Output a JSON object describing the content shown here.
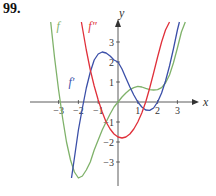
{
  "problem_number": "99.",
  "colors": {
    "f": "#7fb26a",
    "f_prime": "#3b4fa8",
    "f_double_prime": "#e0303a",
    "axis": "#333333"
  },
  "chart_data": {
    "type": "line",
    "title": "",
    "xlabel": "x",
    "ylabel": "y",
    "xlim": [
      -4,
      4
    ],
    "ylim": [
      -4,
      4
    ],
    "x_ticks": [
      -3,
      -2,
      -1,
      1,
      2,
      3
    ],
    "x_tick_labels": [
      "−3",
      "−2",
      "−1",
      "1",
      "2",
      "3"
    ],
    "y_ticks": [
      3,
      2,
      1,
      -1,
      -2,
      -3
    ],
    "y_tick_labels": [
      "3",
      "2",
      "1",
      "−1",
      "−2",
      "−3"
    ],
    "grid": false,
    "legend": "inline curve labels",
    "series": [
      {
        "name": "f",
        "label": "f",
        "x": [
          -3.4,
          -3.2,
          -3.0,
          -2.8,
          -2.6,
          -2.4,
          -2.2,
          -2.0,
          -1.8,
          -1.6,
          -1.4,
          -1.2,
          -1.0,
          -0.8,
          -0.6,
          -0.4,
          -0.2,
          0.0,
          0.2,
          0.4,
          0.6,
          0.8,
          1.0,
          1.2,
          1.4,
          1.6,
          1.8,
          2.0,
          2.2,
          2.4,
          2.6,
          2.8,
          3.0,
          3.2,
          3.4
        ],
        "y": [
          4.0,
          2.2,
          0.6,
          -0.8,
          -2.0,
          -2.9,
          -3.5,
          -3.8,
          -3.7,
          -3.4,
          -3.0,
          -2.4,
          -1.9,
          -1.4,
          -1.0,
          -0.6,
          -0.25,
          0.0,
          0.25,
          0.45,
          0.62,
          0.72,
          0.78,
          0.75,
          0.68,
          0.62,
          0.6,
          0.62,
          0.72,
          0.95,
          1.35,
          1.95,
          2.7,
          3.5,
          4.0
        ]
      },
      {
        "name": "f'",
        "label": "f′",
        "x": [
          -2.35,
          -2.2,
          -2.0,
          -1.8,
          -1.6,
          -1.4,
          -1.2,
          -1.0,
          -0.8,
          -0.6,
          -0.4,
          -0.2,
          0.0,
          0.2,
          0.4,
          0.6,
          0.8,
          1.0,
          1.2,
          1.4,
          1.6,
          1.8,
          2.0,
          2.2,
          2.4,
          2.6,
          2.8,
          3.0,
          3.1
        ],
        "y": [
          -3.8,
          -2.8,
          -1.4,
          -0.3,
          0.7,
          1.5,
          2.1,
          2.4,
          2.5,
          2.45,
          2.3,
          2.1,
          2.0,
          1.65,
          1.2,
          0.75,
          0.35,
          0.0,
          -0.25,
          -0.4,
          -0.42,
          -0.3,
          0.0,
          0.45,
          1.05,
          1.8,
          2.65,
          3.6,
          4.0
        ]
      },
      {
        "name": "f''",
        "label": "f″",
        "x": [
          -1.85,
          -1.6,
          -1.4,
          -1.2,
          -1.0,
          -0.8,
          -0.6,
          -0.4,
          -0.2,
          0.0,
          0.2,
          0.4,
          0.6,
          0.8,
          1.0,
          1.2,
          1.4,
          1.6,
          1.8,
          2.0,
          2.2,
          2.4,
          2.6
        ],
        "y": [
          4.0,
          2.6,
          1.6,
          0.8,
          0.1,
          -0.5,
          -1.0,
          -1.35,
          -1.6,
          -1.75,
          -1.8,
          -1.75,
          -1.6,
          -1.35,
          -1.0,
          -0.55,
          0.0,
          0.7,
          1.45,
          2.25,
          3.0,
          3.6,
          4.0
        ]
      }
    ],
    "annotations": [
      {
        "text": "f",
        "x": -3.1,
        "y": 3.8
      },
      {
        "text": "f″",
        "x": -1.5,
        "y": 3.8
      },
      {
        "text": "f′",
        "x": -2.5,
        "y": 1.0
      }
    ]
  }
}
